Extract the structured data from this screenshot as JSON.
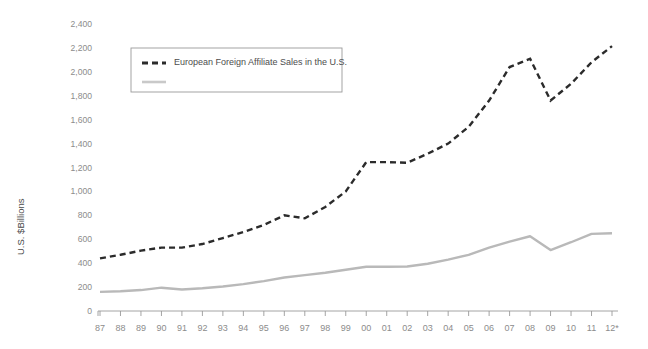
{
  "chart_data": {
    "type": "line",
    "title": "",
    "xlabel": "",
    "ylabel": "U.S. $Billions",
    "ylim": [
      0,
      2400
    ],
    "ytick_step": 200,
    "grid": false,
    "legend_position": "top-left-inside",
    "categories": [
      "87",
      "88",
      "89",
      "90",
      "91",
      "92",
      "93",
      "94",
      "95",
      "96",
      "97",
      "98",
      "99",
      "00",
      "01",
      "02",
      "03",
      "04",
      "05",
      "06",
      "07",
      "08",
      "09",
      "10",
      "11",
      "12*"
    ],
    "ytick_labels": [
      "0",
      "200",
      "400",
      "600",
      "800",
      "1,000",
      "1,200",
      "1,400",
      "1,600",
      "1,800",
      "2,000",
      "2,200",
      "2,400"
    ],
    "ytick_values": [
      0,
      200,
      400,
      600,
      800,
      1000,
      1200,
      1400,
      1600,
      1800,
      2000,
      2200,
      2400
    ],
    "series": [
      {
        "name": "European Foreign Affiliate Sales in the U.S.",
        "style": "dashed",
        "color": "#2b2b2b",
        "legend_label": "European Foreign Affiliate Sales in the U.S.",
        "values": [
          440,
          470,
          505,
          530,
          530,
          560,
          610,
          660,
          720,
          800,
          775,
          870,
          1000,
          1245,
          1245,
          1240,
          1315,
          1400,
          1540,
          1760,
          2040,
          2110,
          1760,
          1900,
          2080,
          2215
        ]
      },
      {
        "name": "",
        "style": "solid",
        "color": "#b9b9b9",
        "legend_label": "",
        "values": [
          160,
          165,
          175,
          195,
          180,
          190,
          205,
          225,
          250,
          280,
          300,
          320,
          345,
          370,
          370,
          372,
          395,
          430,
          470,
          530,
          580,
          625,
          510,
          575,
          645,
          650
        ]
      }
    ],
    "footnote": ""
  },
  "axis": {
    "y_title": "U.S. $Billions"
  },
  "legend": {
    "entries": [
      {
        "label": "European Foreign Affiliate Sales in the U.S.",
        "style": "dashed"
      },
      {
        "label": "",
        "style": "solid"
      }
    ]
  }
}
